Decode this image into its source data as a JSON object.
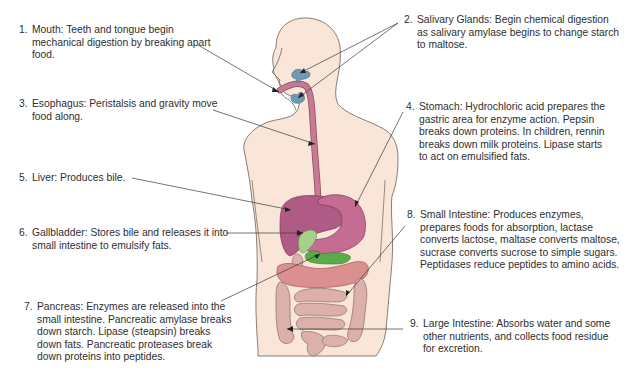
{
  "diagram": {
    "colors": {
      "skin": "#f9e6d8",
      "skin_outline": "#6b6058",
      "esophagus": "#c77a93",
      "liver": "#b05b85",
      "stomach": "#c46c92",
      "gallbladder": "#a8d08a",
      "pancreas": "#5cab4a",
      "transverse_colon": "#dc8f8f",
      "intestine": "#dcb0ab",
      "salivary": "#6e9bb3",
      "leader_line": "#3a3a3a"
    },
    "labels": [
      {
        "number": "1.",
        "organ": "Mouth",
        "text": "Mouth: Teeth and tongue begin mechanical digestion by breaking apart food."
      },
      {
        "number": "2.",
        "organ": "Salivary Glands",
        "text": "Salivary Glands: Begin chemical digestion as salivary amylase begins to change starch to maltose."
      },
      {
        "number": "3.",
        "organ": "Esophagus",
        "text": "Esophagus: Peristalsis and gravity move food along."
      },
      {
        "number": "4.",
        "organ": "Stomach",
        "text": "Stomach: Hydrochloric acid prepares the gastric area for enzyme action. Pepsin breaks down proteins. In children, rennin breaks down milk proteins. Lipase starts to act on emulsified fats."
      },
      {
        "number": "5.",
        "organ": "Liver",
        "text": "Liver: Produces bile."
      },
      {
        "number": "6.",
        "organ": "Gallbladder",
        "text": "Gallbladder: Stores bile and releases it into small intestine to emulsify fats."
      },
      {
        "number": "7.",
        "organ": "Pancreas",
        "text": "Pancreas: Enzymes are released into the small intestine. Pancreatic amylase breaks down starch. Lipase (steapsin) breaks down fats. Pancreatic proteases break down proteins into peptides."
      },
      {
        "number": "8.",
        "organ": "Small Intestine",
        "text": "Small Intestine: Produces enzymes, prepares foods for absorption, lactase converts lactose, maltase converts maltose, sucrase converts sucrose to simple sugars. Peptidases reduce peptides to amino acids."
      },
      {
        "number": "9.",
        "organ": "Large Intestine",
        "text": "Large Intestine: Absorbs water and some other nutrients, and collects food residue for excretion."
      }
    ]
  }
}
